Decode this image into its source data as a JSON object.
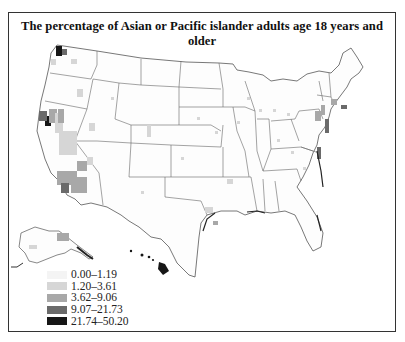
{
  "title": "The percentage of Asian or Pacific islander adults age 18 years and older",
  "legend": {
    "items": [
      {
        "label": "0.00–1.19",
        "color": "#f4f4f4"
      },
      {
        "label": "1.20–3.61",
        "color": "#d6d6d6"
      },
      {
        "label": "3.62–9.06",
        "color": "#a8a8a8"
      },
      {
        "label": "9.07–21.73",
        "color": "#6a6a6a"
      },
      {
        "label": "21.74–50.20",
        "color": "#161616"
      }
    ]
  },
  "map": {
    "region": "United States (counties), including Alaska and Hawaii insets",
    "highlights": [
      {
        "area": "Hawaii",
        "class": "21.74–50.20"
      },
      {
        "area": "San Francisco Bay Area, CA",
        "class": "21.74–50.20"
      },
      {
        "area": "Seattle area, WA",
        "class": "21.74–50.20"
      },
      {
        "area": "Southern California",
        "class": "9.07–21.73"
      },
      {
        "area": "Western Alaska",
        "class": "3.62–9.06"
      },
      {
        "area": "Northeast corridor",
        "class": "3.62–9.06"
      }
    ]
  }
}
